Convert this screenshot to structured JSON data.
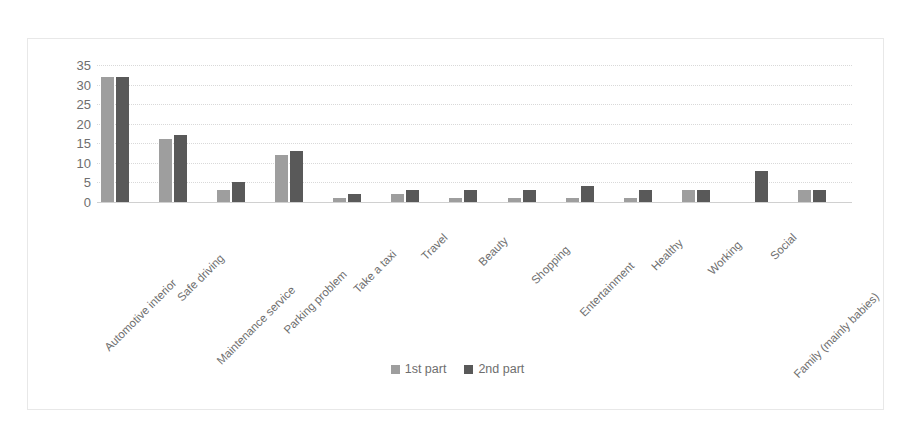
{
  "chart_data": {
    "type": "bar",
    "title": "",
    "subtitle": "",
    "xlabel": "",
    "ylabel": "",
    "ylim": [
      0,
      35
    ],
    "yticks": [
      0,
      5,
      10,
      15,
      20,
      25,
      30,
      35
    ],
    "grid": "horizontal-dotted",
    "legend_position": "bottom-center",
    "categories": [
      "Automotive interior",
      "Safe driving",
      "Maintenance service",
      "Parking problem",
      "Take a taxi",
      "Travel",
      "Beauty",
      "Shopping",
      "Entertainment",
      "Healthy",
      "Working",
      "Social",
      "Family (mainly babies)"
    ],
    "series": [
      {
        "name": "1st part",
        "color": "#9e9e9e",
        "values": [
          32,
          16,
          3,
          12,
          1,
          2,
          1,
          1,
          1,
          1,
          3,
          0,
          3
        ]
      },
      {
        "name": "2nd part",
        "color": "#595959",
        "values": [
          32,
          17,
          5,
          13,
          2,
          3,
          3,
          3,
          4,
          3,
          3,
          8,
          3
        ]
      }
    ]
  },
  "colors": {
    "series_1": "#9e9e9e",
    "series_2": "#595959",
    "gridline": "#d9d9d9",
    "axis": "#d0d0d0",
    "text": "#6e6e6e",
    "border": "#e8e8e8",
    "background": "#ffffff"
  }
}
